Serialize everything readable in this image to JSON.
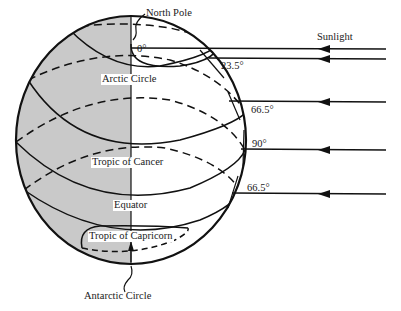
{
  "diagram": {
    "labels": {
      "north_pole": "North Pole",
      "sunlight": "Sunlight",
      "arctic_circle": "Arctic Circle",
      "tropic_of_cancer": "Tropic of Cancer",
      "equator": "Equator",
      "tropic_of_capricorn": "Tropic of Capricorn",
      "antarctic_circle": "Antarctic Circle"
    },
    "angles": {
      "a0": "0°",
      "a23": "23.5°",
      "a66_upper": "66.5°",
      "a90": "90°",
      "a66_lower": "66.5°"
    },
    "colors": {
      "night_shade": "#c9c9c9",
      "line": "#111111",
      "background": "#ffffff"
    }
  }
}
